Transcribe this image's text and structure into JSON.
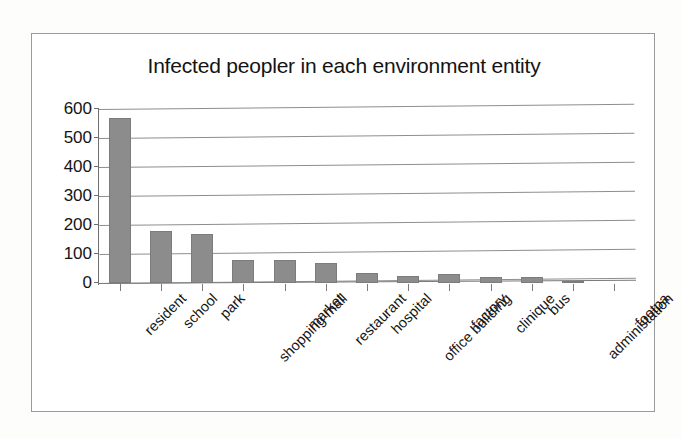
{
  "chart_data": {
    "type": "bar",
    "title": "Infected peopler in each environment entity",
    "xlabel": "",
    "ylabel": "",
    "ylim": [
      0,
      600
    ],
    "yticks": [
      0,
      100,
      200,
      300,
      400,
      500,
      600
    ],
    "grid": true,
    "legend": false,
    "bar_color": "#8c8c8c",
    "categories": [
      "resident",
      "school",
      "park",
      "shopping mall",
      "market",
      "restaurant",
      "hospital",
      "office building",
      "factory",
      "clinique",
      "bus",
      "administation",
      "footpa"
    ],
    "values": [
      570,
      180,
      168,
      80,
      78,
      70,
      35,
      25,
      30,
      22,
      22,
      2,
      0
    ]
  },
  "frame": {
    "border_color": "#9a9a9a",
    "background": "#ffffff"
  }
}
